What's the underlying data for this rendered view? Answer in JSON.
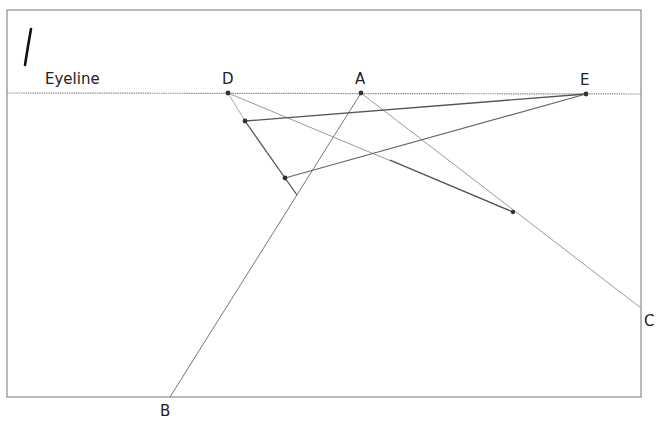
{
  "figure": {
    "step_number_mark": "1",
    "eyeline_label": "Eyeline",
    "points": {
      "D": {
        "label": "D",
        "x": 228,
        "y": 93
      },
      "A": {
        "label": "A",
        "x": 361,
        "y": 93
      },
      "E": {
        "label": "E",
        "x": 586,
        "y": 94
      },
      "B": {
        "label": "B",
        "x": 170,
        "y": 397
      },
      "C": {
        "label": "C",
        "x": 641,
        "y": 308
      }
    },
    "frame": {
      "x1": 7,
      "y1": 10,
      "x2": 641,
      "y2": 397
    },
    "eyeline_y": 93,
    "construction_points": [
      {
        "x": 245,
        "y": 121
      },
      {
        "x": 285,
        "y": 178
      },
      {
        "x": 297,
        "y": 195
      },
      {
        "x": 513,
        "y": 212
      }
    ],
    "colors": {
      "frame": "#8a8a8a",
      "eyeline": "#8f8f8f",
      "dark_line": "#555555",
      "light_line": "#b0b0b0",
      "point": "#333333",
      "text": "#222222"
    }
  }
}
